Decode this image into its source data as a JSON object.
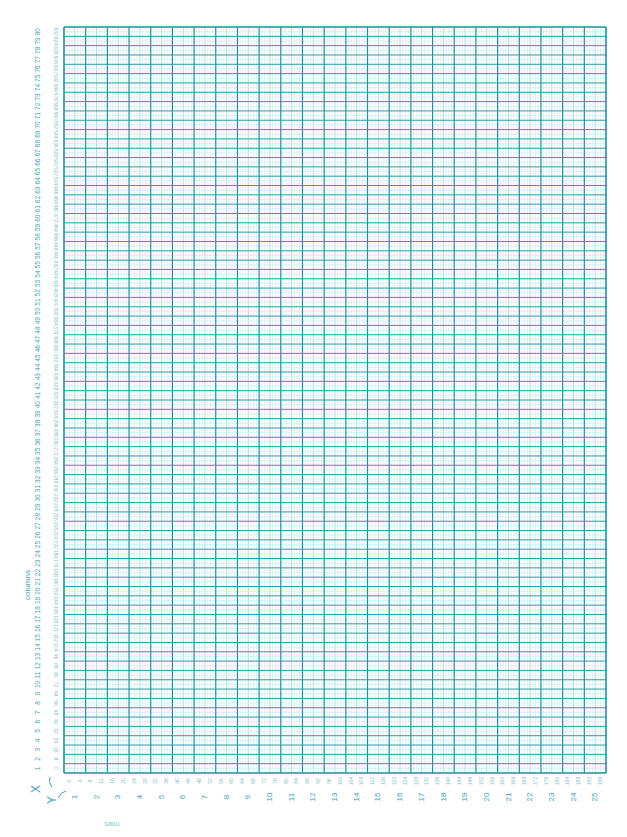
{
  "sheet": {
    "title": "80-COLUMN TEXT/HIGH-RESOLUTION GRAPHICS LAYOUT SHEET",
    "columns_label": "columns",
    "rows_label": "rows",
    "x_axis_label": "X",
    "y_axis_label": "Y",
    "colors": {
      "grid_major": "#1f8f9c",
      "grid_minor": "#8fcfd6",
      "grid_sub": "#cfeef0",
      "label": "#3fa3b2",
      "label_light": "#7fc2cc"
    },
    "grid": {
      "columns": 80,
      "rows": 25,
      "column_numbers": [
        1,
        2,
        3,
        4,
        5,
        6,
        7,
        8,
        9,
        10,
        11,
        12,
        13,
        14,
        15,
        16,
        17,
        18,
        19,
        20,
        21,
        22,
        23,
        24,
        25,
        26,
        27,
        28,
        29,
        30,
        31,
        32,
        33,
        34,
        35,
        36,
        37,
        38,
        39,
        40,
        41,
        42,
        43,
        44,
        45,
        46,
        47,
        48,
        49,
        50,
        51,
        52,
        53,
        54,
        55,
        56,
        57,
        58,
        59,
        60,
        61,
        62,
        63,
        64,
        65,
        66,
        67,
        68,
        69,
        70,
        71,
        72,
        73,
        74,
        75,
        76,
        77,
        78,
        79,
        80
      ],
      "row_numbers": [
        1,
        2,
        3,
        4,
        5,
        6,
        7,
        8,
        9,
        10,
        11,
        12,
        13,
        14,
        15,
        16,
        17,
        18,
        19,
        20,
        21,
        22,
        23,
        24,
        25
      ],
      "x_pixel_step": 8,
      "x_pixel_max": 632,
      "y_pixel_step": 4,
      "y_pixel_max": 196
    }
  }
}
